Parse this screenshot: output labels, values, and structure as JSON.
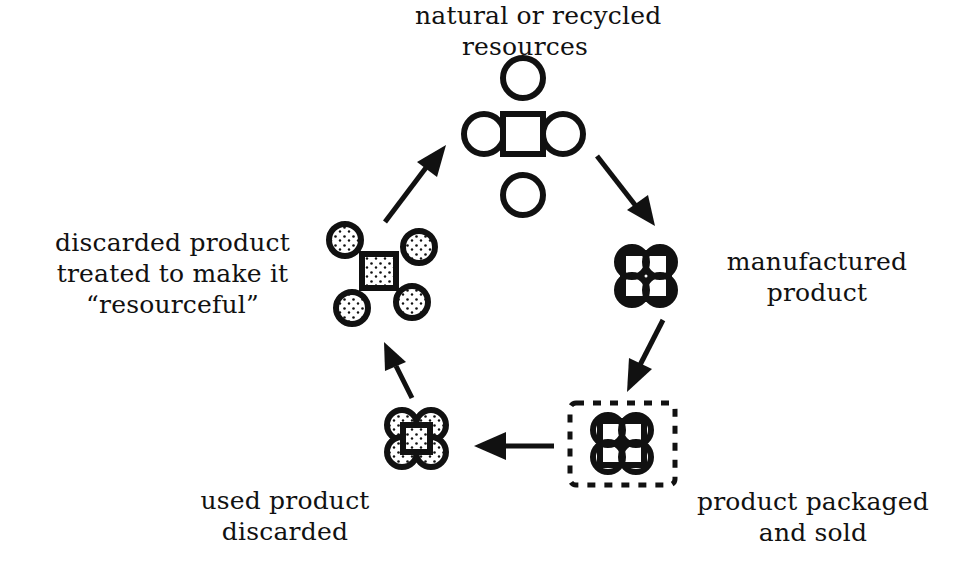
{
  "diagram": {
    "type": "cycle",
    "stages": [
      {
        "id": "resources",
        "lines": [
          "natural or recycled",
          "resources"
        ]
      },
      {
        "id": "manufactured",
        "lines": [
          "manufactured",
          "product"
        ]
      },
      {
        "id": "packaged",
        "lines": [
          "product packaged",
          "and sold"
        ]
      },
      {
        "id": "discarded",
        "lines": [
          "used product",
          "discarded"
        ]
      },
      {
        "id": "treated",
        "lines": [
          "discarded product",
          "treated to make it",
          "“resourceful”"
        ]
      }
    ],
    "arrows": [
      {
        "from": "resources",
        "to": "manufactured"
      },
      {
        "from": "manufactured",
        "to": "packaged"
      },
      {
        "from": "packaged",
        "to": "discarded"
      },
      {
        "from": "discarded",
        "to": "treated"
      },
      {
        "from": "treated",
        "to": "resources"
      }
    ],
    "colors": {
      "ink": "#111111",
      "background": "#ffffff"
    }
  }
}
